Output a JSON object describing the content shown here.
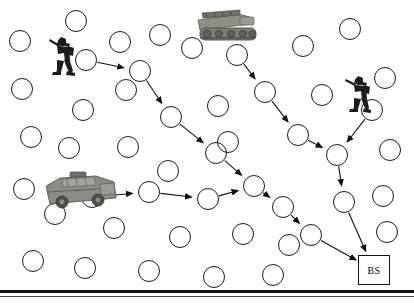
{
  "diagram": {
    "base_station_label": "BS",
    "colors": {
      "node_stroke": "#1a1a1a",
      "edge_stroke": "#111111",
      "background": "#ffffff",
      "frame": "#111111"
    },
    "units": [
      {
        "name": "soldier-left",
        "type": "soldier",
        "x": 44,
        "y": 31,
        "w": 36,
        "h": 46
      },
      {
        "name": "tracked-vehicle-top",
        "type": "tracked-vehicle",
        "x": 194,
        "y": 8,
        "w": 68,
        "h": 44
      },
      {
        "name": "soldier-right",
        "type": "soldier",
        "x": 342,
        "y": 70,
        "w": 34,
        "h": 44
      },
      {
        "name": "armored-vehicle-left",
        "type": "armored-vehicle",
        "x": 40,
        "y": 170,
        "w": 82,
        "h": 42
      }
    ],
    "base_station": {
      "x": 358,
      "y": 255,
      "w": 32,
      "h": 30
    },
    "route_nodes": [
      {
        "id": "r1",
        "x": 86,
        "y": 60,
        "r": 11
      },
      {
        "id": "r2",
        "x": 140,
        "y": 71,
        "r": 11
      },
      {
        "id": "r3",
        "x": 171,
        "y": 117,
        "r": 11
      },
      {
        "id": "r4",
        "x": 216,
        "y": 153,
        "r": 11
      },
      {
        "id": "r5",
        "x": 254,
        "y": 186,
        "r": 11
      },
      {
        "id": "r6",
        "x": 283,
        "y": 207,
        "r": 11
      },
      {
        "id": "r7",
        "x": 311,
        "y": 235,
        "r": 11
      },
      {
        "id": "b1",
        "x": 92,
        "y": 197,
        "r": 11
      },
      {
        "id": "b2",
        "x": 149,
        "y": 192,
        "r": 11
      },
      {
        "id": "b3",
        "x": 208,
        "y": 199,
        "r": 11
      },
      {
        "id": "t1",
        "x": 237,
        "y": 55,
        "r": 11
      },
      {
        "id": "t2",
        "x": 265,
        "y": 92,
        "r": 11
      },
      {
        "id": "t3",
        "x": 298,
        "y": 135,
        "r": 11
      },
      {
        "id": "s1",
        "x": 372,
        "y": 110,
        "r": 11
      },
      {
        "id": "j1",
        "x": 337,
        "y": 155,
        "r": 11
      },
      {
        "id": "j2",
        "x": 344,
        "y": 202,
        "r": 11
      }
    ],
    "idle_nodes": [
      {
        "x": 20,
        "y": 41,
        "r": 11
      },
      {
        "x": 76,
        "y": 21,
        "r": 11
      },
      {
        "x": 120,
        "y": 42,
        "r": 11
      },
      {
        "x": 160,
        "y": 35,
        "r": 11
      },
      {
        "x": 192,
        "y": 48,
        "r": 11
      },
      {
        "x": 303,
        "y": 46,
        "r": 11
      },
      {
        "x": 350,
        "y": 29,
        "r": 11
      },
      {
        "x": 22,
        "y": 89,
        "r": 11
      },
      {
        "x": 83,
        "y": 110,
        "r": 11
      },
      {
        "x": 126,
        "y": 90,
        "r": 11
      },
      {
        "x": 218,
        "y": 106,
        "r": 11
      },
      {
        "x": 322,
        "y": 95,
        "r": 11
      },
      {
        "x": 385,
        "y": 78,
        "r": 11
      },
      {
        "x": 31,
        "y": 137,
        "r": 11
      },
      {
        "x": 69,
        "y": 148,
        "r": 11
      },
      {
        "x": 128,
        "y": 147,
        "r": 11
      },
      {
        "x": 168,
        "y": 171,
        "r": 11
      },
      {
        "x": 228,
        "y": 142,
        "r": 11
      },
      {
        "x": 390,
        "y": 150,
        "r": 11
      },
      {
        "x": 24,
        "y": 189,
        "r": 11
      },
      {
        "x": 55,
        "y": 214,
        "r": 11
      },
      {
        "x": 114,
        "y": 228,
        "r": 11
      },
      {
        "x": 180,
        "y": 237,
        "r": 11
      },
      {
        "x": 243,
        "y": 234,
        "r": 11
      },
      {
        "x": 289,
        "y": 245,
        "r": 11
      },
      {
        "x": 383,
        "y": 196,
        "r": 11
      },
      {
        "x": 387,
        "y": 232,
        "r": 11
      },
      {
        "x": 33,
        "y": 261,
        "r": 11
      },
      {
        "x": 85,
        "y": 268,
        "r": 11
      },
      {
        "x": 149,
        "y": 271,
        "r": 11
      },
      {
        "x": 214,
        "y": 277,
        "r": 11
      },
      {
        "x": 273,
        "y": 275,
        "r": 11
      }
    ],
    "edges": [
      {
        "from": "r1",
        "to": "r2"
      },
      {
        "from": "r2",
        "to": "r3"
      },
      {
        "from": "r3",
        "to": "r4"
      },
      {
        "from": "r4",
        "to": "r5"
      },
      {
        "from": "r5",
        "to": "r6"
      },
      {
        "from": "r6",
        "to": "r7"
      },
      {
        "from": "r7",
        "to": "bs"
      },
      {
        "from": "b1",
        "to": "b2"
      },
      {
        "from": "b2",
        "to": "b3"
      },
      {
        "from": "b3",
        "to": "r5"
      },
      {
        "from": "t1",
        "to": "t2"
      },
      {
        "from": "t2",
        "to": "t3"
      },
      {
        "from": "t3",
        "to": "j1"
      },
      {
        "from": "s1",
        "to": "j1"
      },
      {
        "from": "j1",
        "to": "j2"
      },
      {
        "from": "j2",
        "to": "bs"
      }
    ]
  }
}
